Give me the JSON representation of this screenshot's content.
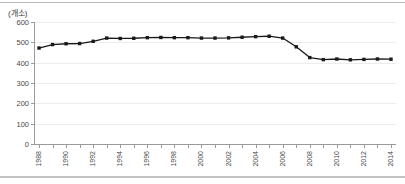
{
  "chart_data": {
    "type": "line",
    "title": "",
    "subtitle": "",
    "xlabel": "",
    "ylabel": "(개소)",
    "unit_label": "(개소)",
    "ylim": [
      0,
      600
    ],
    "ytick_labels": [
      "0",
      "100",
      "200",
      "300",
      "400",
      "500",
      "600"
    ],
    "ytick_values": [
      0,
      100,
      200,
      300,
      400,
      500,
      600
    ],
    "grid": true,
    "legend": false,
    "legend_position": "none",
    "marker": "filled-square",
    "line_color": "#1a1a1a",
    "grid_color": "#ececec",
    "axis_color": "#9a9a9a",
    "x": [
      1988,
      1989,
      1990,
      1991,
      1992,
      1993,
      1994,
      1995,
      1996,
      1997,
      1998,
      1999,
      2000,
      2001,
      2002,
      2003,
      2004,
      2005,
      2006,
      2007,
      2008,
      2009,
      2010,
      2011,
      2012,
      2013,
      2014
    ],
    "xtick_labels": [
      "1988",
      "1990",
      "1992",
      "1994",
      "1996",
      "1998",
      "2000",
      "2002",
      "2004",
      "2006",
      "2008",
      "2010",
      "2012",
      "2014"
    ],
    "xtick_label_values": [
      1988,
      1990,
      1992,
      1994,
      1996,
      1998,
      2000,
      2002,
      2004,
      2006,
      2008,
      2010,
      2012,
      2014
    ],
    "values": [
      472,
      489,
      493,
      494,
      505,
      521,
      519,
      520,
      523,
      524,
      523,
      523,
      521,
      521,
      522,
      525,
      528,
      530,
      521,
      478,
      425,
      415,
      418,
      414,
      416,
      418,
      417
    ]
  }
}
